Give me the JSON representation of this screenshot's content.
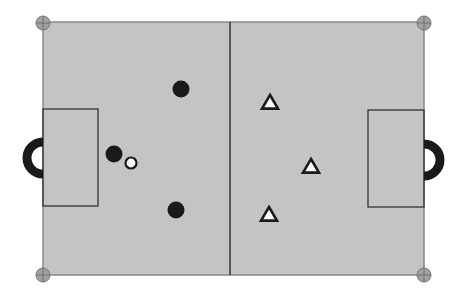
{
  "diagram": {
    "type": "soccer-tactics-board",
    "colors": {
      "pitch": "#c4c4c4",
      "lines": "#333333",
      "corner_marker": "#a0a0a0",
      "team_a": "#1a1a1a",
      "team_b_fill": "#ffffff",
      "team_b_stroke": "#1a1a1a",
      "ball_fill": "#ffffff",
      "goal": "#1a1a1a"
    },
    "pitch": {
      "x": 43,
      "y": 22,
      "width": 381,
      "height": 253,
      "midline_x": 230
    },
    "penalty_areas": [
      {
        "side": "left",
        "x": 43,
        "y": 109,
        "width": 55,
        "height": 97
      },
      {
        "side": "right",
        "x": 368,
        "y": 110,
        "width": 56,
        "height": 97
      }
    ],
    "goals": [
      {
        "side": "left",
        "cx": 43,
        "cy": 158
      },
      {
        "side": "right",
        "cx": 424,
        "cy": 160
      }
    ],
    "corner_markers": [
      {
        "name": "top-left",
        "cx": 43,
        "cy": 23
      },
      {
        "name": "top-right",
        "cx": 424,
        "cy": 23
      },
      {
        "name": "bottom-left",
        "cx": 43,
        "cy": 275
      },
      {
        "name": "bottom-right",
        "cx": 424,
        "cy": 275
      }
    ],
    "team_circles": [
      {
        "cx": 181,
        "cy": 89
      },
      {
        "cx": 114,
        "cy": 154
      },
      {
        "cx": 176,
        "cy": 210
      }
    ],
    "team_triangles": [
      {
        "cx": 270,
        "cy": 103
      },
      {
        "cx": 311,
        "cy": 167
      },
      {
        "cx": 269,
        "cy": 215
      }
    ],
    "ball": {
      "cx": 131,
      "cy": 163
    }
  }
}
